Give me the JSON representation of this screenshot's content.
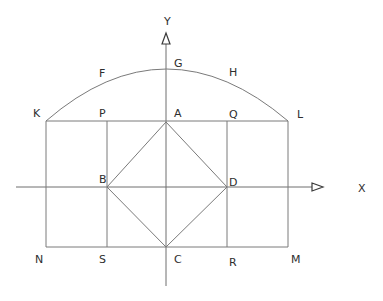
{
  "diagram": {
    "title": "",
    "axes": {
      "x_label": "X",
      "y_label": "Y"
    },
    "points": {
      "A": "A",
      "B": "B",
      "C": "C",
      "D": "D",
      "F": "F",
      "G": "G",
      "H": "H",
      "K": "K",
      "L": "L",
      "M": "M",
      "N": "N",
      "P": "P",
      "Q": "Q",
      "R": "R",
      "S": "S"
    },
    "shapes": [
      {
        "type": "rectangle",
        "vertices": [
          "K",
          "L",
          "M",
          "N"
        ]
      },
      {
        "type": "rectangle",
        "vertices": [
          "P",
          "Q",
          "R",
          "S"
        ]
      },
      {
        "type": "square",
        "vertices": [
          "A",
          "D",
          "C",
          "B"
        ]
      },
      {
        "type": "arc",
        "through": [
          "K",
          "F",
          "G",
          "H",
          "L"
        ]
      }
    ],
    "colors": {
      "line": "#7a7a7a",
      "text": "#2e2e2e",
      "background": "#ffffff"
    }
  }
}
